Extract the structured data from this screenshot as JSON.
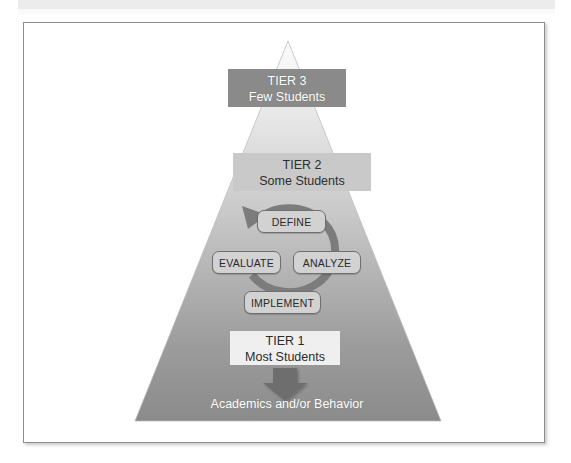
{
  "figure": {
    "title_alt": "Multi-Tiered System of Supports pyramid",
    "pyramid": {
      "tiers": [
        {
          "id": "tier-3",
          "line1": "TIER 3",
          "line2": "Few Students",
          "band_color": "#8a8a8a",
          "text_color": "#ffffff"
        },
        {
          "id": "tier-2",
          "line1": "TIER 2",
          "line2": "Some Students",
          "band_color": "#c9c9c9",
          "text_color": "#2e2e2e"
        },
        {
          "id": "tier-1",
          "line1": "TIER 1",
          "line2": "Most Students",
          "band_color": "#efefef",
          "text_color": "#2b2b2b"
        }
      ],
      "caption": "Academics and/or Behavior",
      "gradient": {
        "top": "#f2f2f2",
        "bottom": "#8c8c8c"
      }
    },
    "cycle": {
      "steps": [
        {
          "id": "define",
          "label": "DEFINE",
          "position": "top"
        },
        {
          "id": "analyze",
          "label": "ANALYZE",
          "position": "right"
        },
        {
          "id": "implement",
          "label": "IMPLEMENT",
          "position": "bottom"
        },
        {
          "id": "evaluate",
          "label": "EVALUATE",
          "position": "left"
        }
      ],
      "arrow_color": "#7a7a7a",
      "direction": "clockwise"
    },
    "down_arrow": {
      "color": "#6e6e6e"
    }
  }
}
